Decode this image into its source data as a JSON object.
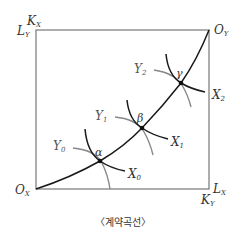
{
  "diagram": {
    "type": "edgeworth-box-contract-curve",
    "caption": "〈계약곡선〉",
    "colors": {
      "box": "#777777",
      "contract_curve": "#1a1a1a",
      "x_indifference": "#1a1a1a",
      "y_indifference": "#888888",
      "text": "#333333"
    },
    "corners": {
      "top_left": {
        "main": "K",
        "sub": "X",
        "main2": "L",
        "sub2": "Y"
      },
      "top_right": {
        "main": "O",
        "sub": "Y"
      },
      "bottom_left": {
        "main": "O",
        "sub": "X"
      },
      "bottom_right": {
        "main": "L",
        "sub": "X",
        "main2": "K",
        "sub2": "Y"
      }
    },
    "points": [
      {
        "name": "α",
        "x": 100,
        "y": 161
      },
      {
        "name": "β",
        "x": 142,
        "y": 128
      },
      {
        "name": "γ",
        "x": 181,
        "y": 83
      }
    ],
    "x_curves": [
      {
        "main": "X",
        "sub": "0"
      },
      {
        "main": "X",
        "sub": "1"
      },
      {
        "main": "X",
        "sub": "2"
      }
    ],
    "y_curves": [
      {
        "main": "Y",
        "sub": "0"
      },
      {
        "main": "Y",
        "sub": "1"
      },
      {
        "main": "Y",
        "sub": "2"
      }
    ]
  }
}
